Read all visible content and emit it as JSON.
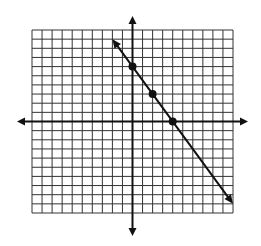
{
  "chart_data": {
    "type": "line",
    "title": "",
    "xlabel": "",
    "ylabel": "",
    "xlim": [
      -10,
      10
    ],
    "ylim": [
      -10,
      10
    ],
    "grid": true,
    "grid_step": 1,
    "axes_arrows": true,
    "series": [
      {
        "name": "line",
        "equation": "y = -1.5x + 6",
        "slope": -1.5,
        "intercept": 6,
        "x_range": [
          -2,
          10
        ],
        "arrows_both_ends": true,
        "points": [
          {
            "x": 0,
            "y": 6
          },
          {
            "x": 2,
            "y": 3
          },
          {
            "x": 4,
            "y": 0
          }
        ]
      }
    ]
  },
  "style": {
    "grid_color": "#333333",
    "axis_color": "#111111",
    "line_color": "#111111",
    "point_color": "#111111",
    "background": "#ffffff"
  },
  "layout": {
    "grid_left_px": 32,
    "grid_top_px": 30,
    "grid_right_px": 233,
    "grid_bottom_px": 213,
    "x_axis_arrow_left_px": 17,
    "x_axis_arrow_right_px": 248,
    "y_axis_arrow_top_px": 16,
    "y_axis_arrow_bottom_px": 236
  }
}
